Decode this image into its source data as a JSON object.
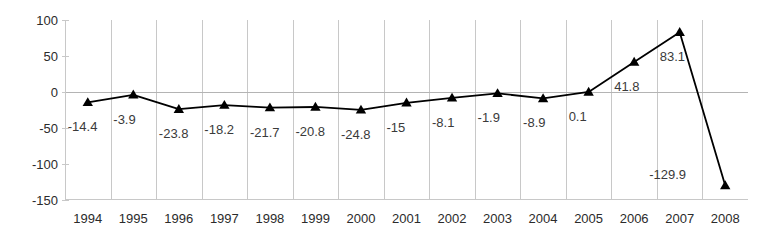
{
  "chart_data": {
    "type": "line",
    "title": "",
    "subtitle": "",
    "xlabel": "",
    "ylabel": "",
    "categories": [
      "1994",
      "1995",
      "1996",
      "1997",
      "1998",
      "1999",
      "2000",
      "2001",
      "2002",
      "2003",
      "2004",
      "2005",
      "2006",
      "2007",
      "2008"
    ],
    "values": [
      -14.4,
      -3.9,
      -23.8,
      -18.2,
      -21.7,
      -20.8,
      -24.8,
      -15,
      -8.1,
      -1.9,
      -8.9,
      0.1,
      41.8,
      83.1,
      -129.9
    ],
    "point_labels": [
      "-14.4",
      "-3.9",
      "-23.8",
      "-18.2",
      "-21.7",
      "-20.8",
      "-24.8",
      "-15",
      "-8.1",
      "-1.9",
      "-8.9",
      "0.1",
      "41.8",
      "83.1",
      "-129.9"
    ],
    "ylim": [
      -150,
      100
    ],
    "yticks": [
      100,
      50,
      0,
      -50,
      -100,
      -150
    ],
    "ytick_labels": [
      "100",
      "50",
      "0",
      "-50",
      "-100",
      "-150"
    ],
    "grid": {
      "vertical": true,
      "horizontal_zero_only": true
    },
    "legend": {
      "visible": false,
      "position": "none",
      "entries": []
    },
    "series": [
      {
        "name": "",
        "marker": "triangle",
        "line_color": "#000000",
        "marker_color": "#000000",
        "values": [
          -14.4,
          -3.9,
          -23.8,
          -18.2,
          -21.7,
          -20.8,
          -24.8,
          -15,
          -8.1,
          -1.9,
          -8.9,
          0.1,
          41.8,
          83.1,
          -129.9
        ]
      }
    ],
    "colors": {
      "line": "#000000",
      "marker": "#000000",
      "grid": "#c8c8c8",
      "zero_line": "#b4b4b4",
      "axis_text": "#2b2b2b",
      "data_label_text": "#3a3a3a",
      "background": "#ffffff"
    }
  }
}
